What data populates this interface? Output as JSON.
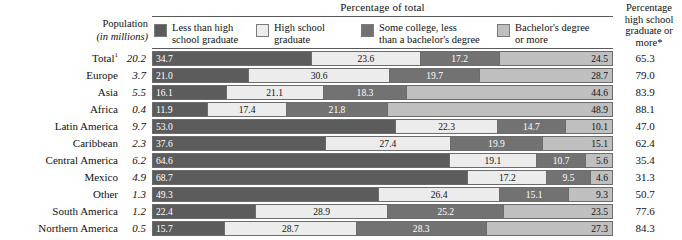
{
  "header": {
    "chart_title": "Percentage of total",
    "population_label_line1": "Population",
    "population_label_line2": "(in millions)",
    "right_col_header": "Percentage\nhigh school\ngraduate\nor more*"
  },
  "legend": [
    {
      "name": "less-than-high-school",
      "label": "Less than high\nschool graduate",
      "color": "#5c5c5c"
    },
    {
      "name": "high-school-graduate",
      "label": "High school\ngraduate",
      "color": "#ececec"
    },
    {
      "name": "some-college",
      "label": "Some college, less\nthan a bachelor's degree",
      "color": "#727272"
    },
    {
      "name": "bachelors-or-more",
      "label": "Bachelor's degree\nor more",
      "color": "#bfbfbf"
    }
  ],
  "chart_data": {
    "type": "bar",
    "subtype": "stacked-horizontal-100",
    "title": "Percentage of total",
    "xlabel": "",
    "ylabel": "",
    "xlim": [
      0,
      100
    ],
    "grid": false,
    "legend_position": "top",
    "categories": [
      "Total¹",
      "Europe",
      "Asia",
      "Africa",
      "Latin America",
      "Caribbean",
      "Central America",
      "Mexico",
      "Other",
      "South America",
      "Northern America"
    ],
    "series": [
      {
        "name": "Less than high school graduate",
        "values": [
          34.7,
          21.0,
          16.1,
          11.9,
          53.0,
          37.6,
          64.6,
          68.7,
          49.3,
          22.4,
          15.7
        ]
      },
      {
        "name": "High school graduate",
        "values": [
          23.6,
          30.6,
          21.1,
          17.4,
          22.3,
          27.4,
          19.1,
          17.2,
          26.4,
          28.9,
          28.7
        ]
      },
      {
        "name": "Some college, less than a bachelor's degree",
        "values": [
          17.2,
          19.7,
          18.3,
          21.8,
          14.7,
          19.9,
          10.7,
          9.5,
          15.1,
          25.2,
          28.3
        ]
      },
      {
        "name": "Bachelor's degree or more",
        "values": [
          24.5,
          28.7,
          44.6,
          48.9,
          10.1,
          15.1,
          5.6,
          4.6,
          9.3,
          23.5,
          27.3
        ]
      }
    ],
    "population_millions": [
      20.2,
      3.7,
      5.5,
      0.4,
      9.7,
      2.3,
      6.2,
      4.9,
      1.3,
      1.2,
      0.5
    ],
    "pct_hs_grad_or_more": [
      65.3,
      79.0,
      83.9,
      88.1,
      47.0,
      62.4,
      35.4,
      31.3,
      50.7,
      77.6,
      84.3
    ]
  },
  "rows": [
    {
      "label": "Total",
      "sup": "1",
      "indent": 0,
      "population": "20.2",
      "segments": [
        "34.7",
        "23.6",
        "17.2",
        "24.5"
      ],
      "right": "65.3"
    },
    {
      "label": "Europe",
      "sup": "",
      "indent": 1,
      "population": "3.7",
      "segments": [
        "21.0",
        "30.6",
        "19.7",
        "28.7"
      ],
      "right": "79.0"
    },
    {
      "label": "Asia",
      "sup": "",
      "indent": 1,
      "population": "5.5",
      "segments": [
        "16.1",
        "21.1",
        "18.3",
        "44.6"
      ],
      "right": "83.9"
    },
    {
      "label": "Africa",
      "sup": "",
      "indent": 1,
      "population": "0.4",
      "segments": [
        "11.9",
        "17.4",
        "21.8",
        "48.9"
      ],
      "right": "88.1"
    },
    {
      "label": "Latin America",
      "sup": "",
      "indent": 1,
      "population": "9.7",
      "segments": [
        "53.0",
        "22.3",
        "14.7",
        "10.1"
      ],
      "right": "47.0"
    },
    {
      "label": "Caribbean",
      "sup": "",
      "indent": 2,
      "population": "2.3",
      "segments": [
        "37.6",
        "27.4",
        "19.9",
        "15.1"
      ],
      "right": "62.4"
    },
    {
      "label": "Central America",
      "sup": "",
      "indent": 2,
      "population": "6.2",
      "segments": [
        "64.6",
        "19.1",
        "10.7",
        "5.6"
      ],
      "right": "35.4"
    },
    {
      "label": "Mexico",
      "sup": "",
      "indent": 3,
      "population": "4.9",
      "segments": [
        "68.7",
        "17.2",
        "9.5",
        "4.6"
      ],
      "right": "31.3"
    },
    {
      "label": "Other",
      "sup": "",
      "indent": 3,
      "population": "1.3",
      "segments": [
        "49.3",
        "26.4",
        "15.1",
        "9.3"
      ],
      "right": "50.7"
    },
    {
      "label": "South America",
      "sup": "",
      "indent": 2,
      "population": "1.2",
      "segments": [
        "22.4",
        "28.9",
        "25.2",
        "23.5"
      ],
      "right": "77.6"
    },
    {
      "label": "Northern America",
      "sup": "",
      "indent": 1,
      "population": "0.5",
      "segments": [
        "15.7",
        "28.7",
        "28.3",
        "27.3"
      ],
      "right": "84.3"
    }
  ]
}
